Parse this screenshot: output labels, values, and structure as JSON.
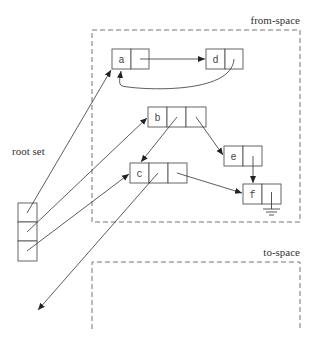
{
  "diagram": {
    "regions": [
      {
        "id": "from-space",
        "label": "from-space"
      },
      {
        "id": "to-space",
        "label": "to-space"
      }
    ],
    "root_set": {
      "label": "root set",
      "cells": 3
    },
    "nodes": [
      {
        "id": "a",
        "label": "a",
        "fields": 1
      },
      {
        "id": "d",
        "label": "d",
        "fields": 1
      },
      {
        "id": "b",
        "label": "b",
        "fields": 2
      },
      {
        "id": "c",
        "label": "c",
        "fields": 2
      },
      {
        "id": "e",
        "label": "e",
        "fields": 1
      },
      {
        "id": "f",
        "label": "f",
        "fields": 1,
        "null_pointer": true
      }
    ],
    "edges": [
      {
        "from": "root[0]",
        "to": "a"
      },
      {
        "from": "root[1]",
        "to": "b"
      },
      {
        "from": "root[2]",
        "to": "c"
      },
      {
        "from": "a.0",
        "to": "d"
      },
      {
        "from": "d.0",
        "to": "a"
      },
      {
        "from": "b.0",
        "to": "c"
      },
      {
        "from": "b.1",
        "to": "e"
      },
      {
        "from": "c.0",
        "to": "outside"
      },
      {
        "from": "c.1",
        "to": "f"
      },
      {
        "from": "e.0",
        "to": "f"
      },
      {
        "from": "f.0",
        "to": "null"
      }
    ]
  }
}
